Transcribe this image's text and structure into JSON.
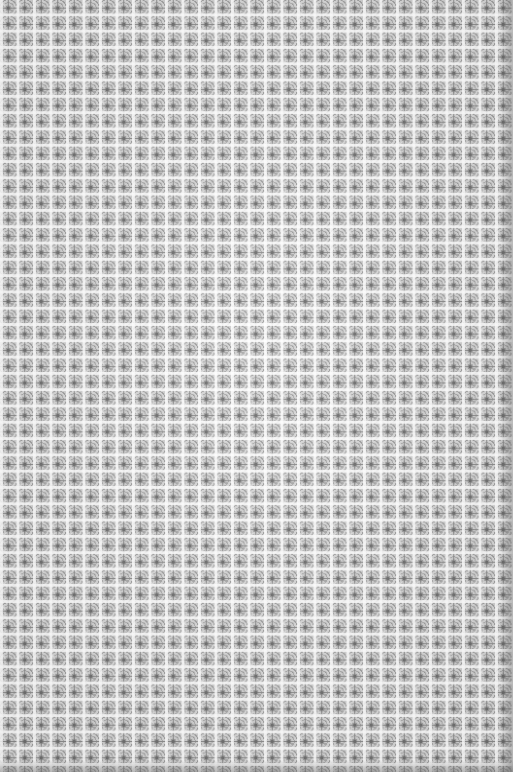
{
  "image": {
    "description": "Seamless grayscale tile texture",
    "pattern": "repeating square tiles with cross/diamond motif separated by white grid lines",
    "tile_size_px": 16,
    "colors": {
      "base": "#b9b9b9",
      "grid_line": "#ffffff",
      "motif_dark": "#6e6e6e",
      "motif_mid": "#9d9d9d",
      "edge_shadow": "#505050"
    }
  }
}
